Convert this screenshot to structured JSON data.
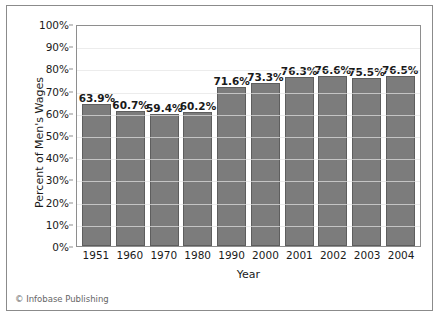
{
  "credit": "© Infobase Publishing",
  "chart_data": {
    "type": "bar",
    "title": "",
    "xlabel": "Year",
    "ylabel": "Percent of Men's Wages",
    "categories": [
      "1951",
      "1960",
      "1970",
      "1980",
      "1990",
      "2000",
      "2001",
      "2002",
      "2003",
      "2004"
    ],
    "values": [
      63.9,
      60.7,
      59.4,
      60.2,
      71.6,
      73.3,
      76.3,
      76.6,
      75.5,
      76.5
    ],
    "value_labels": [
      "63.9%",
      "60.7%",
      "59.4%",
      "60.2%",
      "71.6%",
      "73.3%",
      "76.3%",
      "76.6%",
      "75.5%",
      "76.5%"
    ],
    "ylim": [
      0,
      100
    ],
    "ytick_labels": [
      "100%",
      "90%",
      "80%",
      "70%",
      "60%",
      "50%",
      "40%",
      "30%",
      "20%",
      "10%",
      "0%"
    ],
    "ytick_values": [
      100,
      90,
      80,
      70,
      60,
      50,
      40,
      30,
      20,
      10,
      0
    ],
    "grid": true,
    "legend": false,
    "bar_color": "#7c7c7c",
    "bar_border_color": "#5e5e5e",
    "gridline_color": "#d4d4d4",
    "axis_color": "#8e8e8e"
  }
}
